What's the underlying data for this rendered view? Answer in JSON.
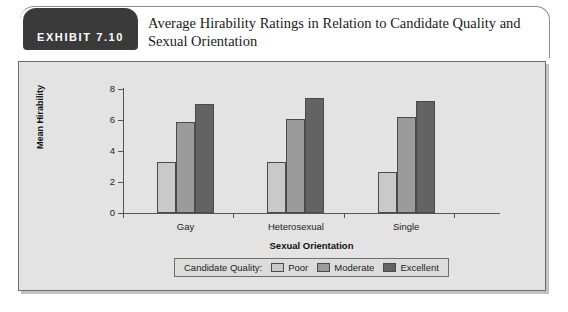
{
  "exhibit": {
    "badge_label": "EXHIBIT 7.10",
    "title": "Average Hirability Ratings in Relation to Candidate Quality and Sexual Orientation"
  },
  "legend": {
    "title": "Candidate Quality:",
    "entries": [
      {
        "label": "Poor",
        "color": "#c9c9c9"
      },
      {
        "label": "Moderate",
        "color": "#9b9b9b"
      },
      {
        "label": "Excellent",
        "color": "#636363"
      }
    ]
  },
  "chart_data": {
    "type": "bar",
    "title": "Average Hirability Ratings in Relation to Candidate Quality and Sexual Orientation",
    "xlabel": "Sexual Orientation",
    "ylabel": "Mean Hirability",
    "categories": [
      "Gay",
      "Heterosexual",
      "Single"
    ],
    "series": [
      {
        "name": "Poor",
        "color": "#c9c9c9",
        "values": [
          3.3,
          3.3,
          2.65
        ]
      },
      {
        "name": "Moderate",
        "color": "#9b9b9b",
        "values": [
          5.9,
          6.05,
          6.2
        ]
      },
      {
        "name": "Excellent",
        "color": "#636363",
        "values": [
          7.05,
          7.45,
          7.25
        ]
      }
    ],
    "ylim": [
      0,
      8
    ],
    "yticks": [
      0,
      2,
      4,
      6,
      8
    ],
    "ytick_labels": [
      "0",
      "2",
      "4",
      "6",
      "8"
    ],
    "grid": false,
    "legend_position": "bottom"
  }
}
